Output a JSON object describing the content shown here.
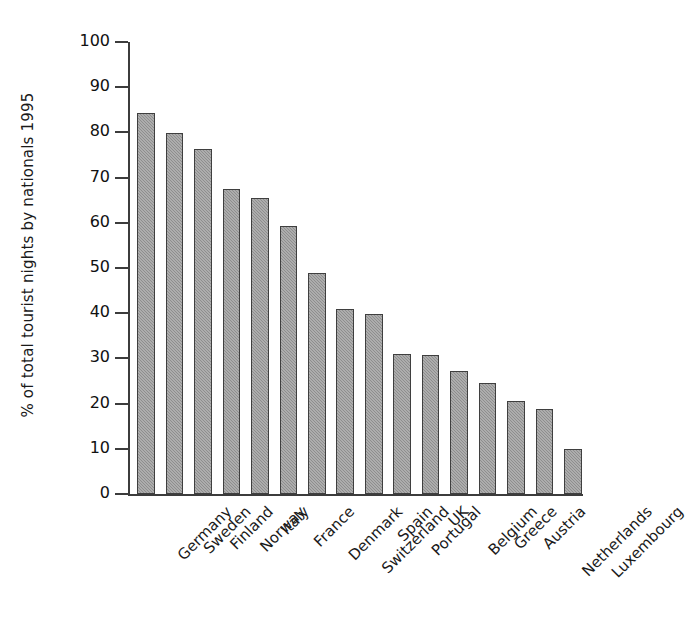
{
  "chart_data": {
    "type": "bar",
    "title": "",
    "subtitle": "",
    "xlabel": "",
    "ylabel": "% of total tourist nights by nationals 1995",
    "ylim": [
      0,
      100
    ],
    "ytick_labels": [
      "100",
      "90",
      "80",
      "70",
      "60",
      "50",
      "40",
      "30",
      "20",
      "10",
      "0"
    ],
    "ytick_values": [
      100,
      90,
      80,
      70,
      60,
      50,
      40,
      30,
      20,
      10,
      0
    ],
    "grid": false,
    "legend": false,
    "legend_position": "none",
    "bar_fill_color": "#8e8e8e",
    "bar_edge_color": "#3f3f3f",
    "axis_color": "#3c3c3c",
    "categories": [
      "Germany",
      "Sweden",
      "Finland",
      "Norway",
      "Italy",
      "France",
      "Denmark",
      "Switzerland",
      "Spain",
      "Portugal",
      "UK",
      "Belgium",
      "Greece",
      "Austria",
      "Netherlands",
      "Luxembourg"
    ],
    "values": [
      84.3,
      79.8,
      76.4,
      67.4,
      65.4,
      59.4,
      48.8,
      41.0,
      39.8,
      30.9,
      30.8,
      27.2,
      24.6,
      20.5,
      18.7,
      9.9
    ]
  }
}
